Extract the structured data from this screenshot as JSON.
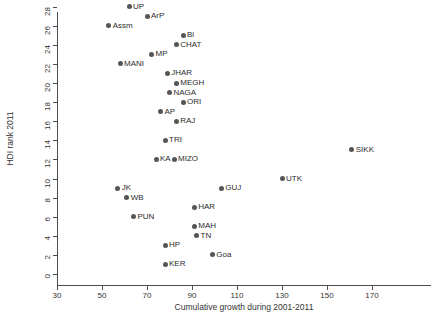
{
  "chart_data": {
    "type": "scatter",
    "title": "",
    "xlabel": "Cumulative growth during 2001-2011",
    "ylabel": "HDI rank 2011",
    "xlim": [
      28,
      180
    ],
    "ylim": [
      -1,
      31
    ],
    "xticks": [
      30,
      50,
      70,
      90,
      110,
      130,
      150,
      170
    ],
    "yticks": [
      0,
      2,
      4,
      6,
      8,
      10,
      12,
      14,
      16,
      18,
      20,
      22,
      24,
      26,
      28,
      30
    ],
    "grid": false,
    "legend": "none",
    "marker_color": "#555555",
    "axis_color": "#4d4d4d",
    "points": [
      {
        "label": "UP",
        "x": 62,
        "y": 28
      },
      {
        "label": "ArP",
        "x": 70,
        "y": 27
      },
      {
        "label": "Assm",
        "x": 53,
        "y": 26
      },
      {
        "label": "Bi",
        "x": 86,
        "y": 25
      },
      {
        "label": "CHAT",
        "x": 83,
        "y": 24
      },
      {
        "label": "MP",
        "x": 72,
        "y": 23
      },
      {
        "label": "MANI",
        "x": 58,
        "y": 22
      },
      {
        "label": "JHAR",
        "x": 79,
        "y": 21
      },
      {
        "label": "MEGH",
        "x": 83,
        "y": 20
      },
      {
        "label": "NAGA",
        "x": 80,
        "y": 19
      },
      {
        "label": "ORI",
        "x": 86,
        "y": 18
      },
      {
        "label": "AP",
        "x": 76,
        "y": 17
      },
      {
        "label": "RAJ",
        "x": 83,
        "y": 16
      },
      {
        "label": "TRI",
        "x": 78,
        "y": 14
      },
      {
        "label": "SIKK",
        "x": 161,
        "y": 13
      },
      {
        "label": "KA",
        "x": 74,
        "y": 12
      },
      {
        "label": "MIZO",
        "x": 82,
        "y": 12
      },
      {
        "label": "UTK",
        "x": 130,
        "y": 10
      },
      {
        "label": "GUJ",
        "x": 103,
        "y": 9
      },
      {
        "label": "JK",
        "x": 57,
        "y": 9
      },
      {
        "label": "WB",
        "x": 61,
        "y": 8
      },
      {
        "label": "HAR",
        "x": 91,
        "y": 7
      },
      {
        "label": "PUN",
        "x": 64,
        "y": 6
      },
      {
        "label": "MAH",
        "x": 91,
        "y": 5
      },
      {
        "label": "TN",
        "x": 92,
        "y": 4
      },
      {
        "label": "HP",
        "x": 78,
        "y": 3
      },
      {
        "label": "Goa",
        "x": 99,
        "y": 2
      },
      {
        "label": "KER",
        "x": 78,
        "y": 1
      }
    ]
  }
}
